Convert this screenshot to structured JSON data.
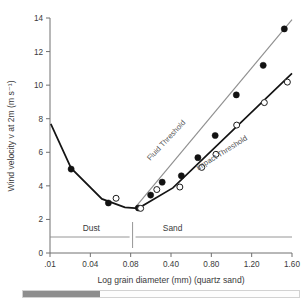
{
  "chart_data": {
    "type": "line",
    "title": "",
    "xlabel": "Log grain diameter (mm) (quartz sand)",
    "ylabel": "Wind velocity v at 2m (m s⁻¹)",
    "xtick_labels": [
      ".01",
      "0.04",
      "0.08",
      "0.40",
      "0.80",
      "1.20",
      "1.60"
    ],
    "ytick_labels": [
      "0",
      "2",
      "4",
      "6",
      "8",
      "10",
      "12",
      "14"
    ],
    "ylim": [
      0,
      14
    ],
    "grid": false,
    "legend_position": "inline-curve-labels",
    "annotations": [
      {
        "name": "fluid-threshold-label",
        "text": "Fluid Threshold"
      },
      {
        "name": "impact-threshold-label",
        "text": "Impact Threshold"
      },
      {
        "name": "dust-zone-label",
        "text": "Dust"
      },
      {
        "name": "sand-zone-label",
        "text": "Sand"
      }
    ],
    "series": [
      {
        "name": "Fluid Threshold",
        "marker": "filled-circle",
        "values": [
          {
            "x": 0.55,
            "y": 5.0
          },
          {
            "x": 1.52,
            "y": 2.98
          },
          {
            "x": 2.3,
            "y": 2.68
          },
          {
            "x": 2.62,
            "y": 3.45
          },
          {
            "x": 2.92,
            "y": 4.22
          },
          {
            "x": 3.42,
            "y": 4.6
          },
          {
            "x": 3.85,
            "y": 5.68
          },
          {
            "x": 4.3,
            "y": 7.0
          },
          {
            "x": 4.85,
            "y": 9.42
          },
          {
            "x": 5.55,
            "y": 11.18
          },
          {
            "x": 6.1,
            "y": 13.35
          }
        ]
      },
      {
        "name": "Impact Threshold",
        "marker": "open-circle",
        "values": [
          {
            "x": 1.72,
            "y": 3.26
          },
          {
            "x": 2.36,
            "y": 2.66
          },
          {
            "x": 2.78,
            "y": 3.78
          },
          {
            "x": 3.38,
            "y": 3.93
          },
          {
            "x": 3.95,
            "y": 5.1
          },
          {
            "x": 4.32,
            "y": 5.88
          },
          {
            "x": 4.86,
            "y": 7.62
          },
          {
            "x": 5.58,
            "y": 8.96
          },
          {
            "x": 6.18,
            "y": 10.18
          }
        ]
      }
    ],
    "curves": [
      {
        "name": "fluid-threshold-curve",
        "style": "thin-grey",
        "points": [
          {
            "x": 2.22,
            "y": 2.72
          },
          {
            "x": 6.3,
            "y": 13.9
          }
        ]
      },
      {
        "name": "impact-threshold-curve",
        "style": "thick-black",
        "points": [
          {
            "x": 0.02,
            "y": 7.7
          },
          {
            "x": 0.55,
            "y": 5.05
          },
          {
            "x": 1.35,
            "y": 3.22
          },
          {
            "x": 1.95,
            "y": 2.72
          },
          {
            "x": 2.3,
            "y": 2.66
          },
          {
            "x": 3.2,
            "y": 3.88
          },
          {
            "x": 6.3,
            "y": 10.7
          }
        ]
      }
    ],
    "zone_divider_x": 2.15
  },
  "scrollbar": {
    "name": "horizontal-scrollbar",
    "thumb_percent": 28
  }
}
